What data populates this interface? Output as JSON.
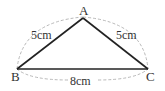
{
  "diagram": {
    "type": "triangle",
    "vertices": {
      "A": {
        "label": "A"
      },
      "B": {
        "label": "B"
      },
      "C": {
        "label": "C"
      }
    },
    "sides": {
      "AB": {
        "label": "5cm"
      },
      "AC": {
        "label": "5cm"
      },
      "BC": {
        "label": "8cm"
      }
    },
    "colors": {
      "edge": "#222222",
      "dimension_arc": "#aaaaaa",
      "text": "#333333"
    }
  }
}
